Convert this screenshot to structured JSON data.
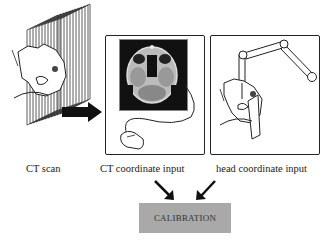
{
  "panels": [
    {
      "id": "ct-scan",
      "label": "CT scan"
    },
    {
      "id": "ct-coordinate-input",
      "label": "CT coordinate  input"
    },
    {
      "id": "head-coordinate-input",
      "label": "head coordinate input"
    }
  ],
  "result": {
    "label": "CALIBRATION"
  },
  "colors": {
    "line": "#222222",
    "calibration_fill": "#a9a9a9",
    "ct_background": "#111111"
  }
}
